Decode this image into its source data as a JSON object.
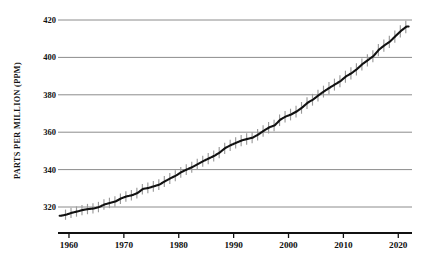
{
  "chart_data": {
    "type": "line",
    "title": "",
    "subtitle": "",
    "xlabel": "",
    "ylabel": "PARTS PER MILLION (PPM)",
    "xlim": [
      1958,
      2022.5
    ],
    "ylim": [
      312,
      424
    ],
    "grid": true,
    "legend": null,
    "xticks": [
      1960,
      1970,
      1980,
      1990,
      2000,
      2010,
      2020
    ],
    "xtick_labels": [
      "1960",
      "1970",
      "1980",
      "1990",
      "2000",
      "2010",
      "2020"
    ],
    "yticks": [
      320,
      340,
      360,
      380,
      400,
      420
    ],
    "ytick_labels": [
      "320",
      "340",
      "360",
      "380",
      "400",
      "420"
    ],
    "colors": {
      "trend_line": "#111111",
      "seasonal_band": "#9a9a9a",
      "gridline": "#8c8c8c",
      "axis": "#111111",
      "background": "#ffffff",
      "text": "#111111"
    },
    "series": [
      {
        "name": "Annual mean CO2 (trend)",
        "x": [
          1958.5,
          1959.5,
          1960.5,
          1961.5,
          1962.5,
          1963.5,
          1964.5,
          1965.5,
          1966.5,
          1967.5,
          1968.5,
          1969.5,
          1970.5,
          1971.5,
          1972.5,
          1973.5,
          1974.5,
          1975.5,
          1976.5,
          1977.5,
          1978.5,
          1979.5,
          1980.5,
          1981.5,
          1982.5,
          1983.5,
          1984.5,
          1985.5,
          1986.5,
          1987.5,
          1988.5,
          1989.5,
          1990.5,
          1991.5,
          1992.5,
          1993.5,
          1994.5,
          1995.5,
          1996.5,
          1997.5,
          1998.5,
          1999.5,
          2000.5,
          2001.5,
          2002.5,
          2003.5,
          2004.5,
          2005.5,
          2006.5,
          2007.5,
          2008.5,
          2009.5,
          2010.5,
          2011.5,
          2012.5,
          2013.5,
          2014.5,
          2015.5,
          2016.5,
          2017.5,
          2018.5,
          2019.5,
          2020.5,
          2021.5
        ],
        "values": [
          315.3,
          315.9,
          316.9,
          317.6,
          318.4,
          318.9,
          319.2,
          320.0,
          321.4,
          322.2,
          323.0,
          324.6,
          325.7,
          326.3,
          327.5,
          329.7,
          330.2,
          331.1,
          332.0,
          333.8,
          335.4,
          336.8,
          338.7,
          340.1,
          341.4,
          343.0,
          344.6,
          346.0,
          347.4,
          349.2,
          351.6,
          353.1,
          354.4,
          355.6,
          356.4,
          357.1,
          358.8,
          360.8,
          362.6,
          363.7,
          366.7,
          368.4,
          369.5,
          371.1,
          373.2,
          375.8,
          377.5,
          379.8,
          381.9,
          383.8,
          385.6,
          387.4,
          389.9,
          391.6,
          393.8,
          396.5,
          398.6,
          400.8,
          404.2,
          406.5,
          408.5,
          411.4,
          414.2,
          416.5
        ]
      },
      {
        "name": "Seasonal cycle amplitude (peak-to-trough, ppm)",
        "x": [
          1958.5,
          1970.5,
          1980.5,
          1990.5,
          2000.5,
          2010.5,
          2021.5
        ],
        "values": [
          5.6,
          5.8,
          6.0,
          6.2,
          6.4,
          6.6,
          6.8
        ]
      }
    ],
    "annotations": []
  },
  "axis": {
    "y_title": "PARTS PER MILLION (PPM)"
  }
}
